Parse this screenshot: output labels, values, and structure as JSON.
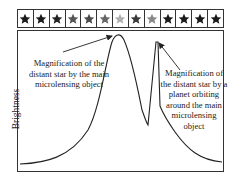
{
  "star_strip": {
    "stars": [
      {
        "shade": "#1a1a1a"
      },
      {
        "shade": "#1a1a1a"
      },
      {
        "shade": "#222222"
      },
      {
        "shade": "#555555"
      },
      {
        "shade": "#4a4a4a"
      },
      {
        "shade": "#666666"
      },
      {
        "shade": "#b0b0b0"
      },
      {
        "shade": "#3a3a3a"
      },
      {
        "shade": "#888888"
      },
      {
        "shade": "#1a1a1a"
      },
      {
        "shade": "#1a1a1a"
      },
      {
        "shade": "#1a1a1a"
      },
      {
        "shade": "#1a1a1a"
      }
    ]
  },
  "axes": {
    "ylabel": "Brightness",
    "xlabel": ""
  },
  "annotations": {
    "main": "Magnification of the distant star by the main microlensing object",
    "planet": "Magnification of the distant star by a planet orbiting around the main microlensing object"
  },
  "chart_data": {
    "type": "line",
    "title": "",
    "xlabel": "",
    "ylabel": "Brightness",
    "grid": false,
    "x": [
      0,
      10,
      20,
      30,
      35,
      40,
      45,
      48,
      50,
      52,
      55,
      58,
      60,
      62,
      64,
      66,
      67,
      68,
      70,
      72,
      75,
      80,
      85,
      90,
      100
    ],
    "values": [
      2,
      4,
      8,
      18,
      28,
      45,
      72,
      88,
      95,
      99,
      96,
      85,
      70,
      50,
      40,
      35,
      40,
      93,
      60,
      38,
      30,
      22,
      12,
      6,
      4
    ],
    "annotations": [
      {
        "x": 52,
        "text": "Magnification of the distant star by the main microlensing object"
      },
      {
        "x": 67,
        "text": "Magnification of the distant star by a planet orbiting around the main microlensing object"
      }
    ]
  }
}
